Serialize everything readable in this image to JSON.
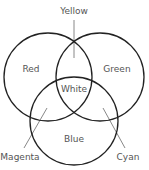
{
  "diagram": {
    "type": "venn",
    "title": "",
    "colors": {
      "circle_stroke": "#222222",
      "leader_line": "#888888",
      "label_text": "#555555",
      "background": "#ffffff"
    },
    "sets": [
      {
        "id": "red",
        "label": "Red",
        "cx": 48,
        "cy": 77,
        "r": 44
      },
      {
        "id": "green",
        "label": "Green",
        "cx": 100,
        "cy": 77,
        "r": 44
      },
      {
        "id": "blue",
        "label": "Blue",
        "cx": 74,
        "cy": 121,
        "r": 44
      }
    ],
    "labels": {
      "red": "Red",
      "green": "Green",
      "blue": "Blue",
      "white": "White",
      "yellow": "Yellow",
      "magenta": "Magenta",
      "cyan": "Cyan"
    },
    "intersections": [
      {
        "sets": [
          "red",
          "green"
        ],
        "label": "Yellow"
      },
      {
        "sets": [
          "red",
          "blue"
        ],
        "label": "Magenta"
      },
      {
        "sets": [
          "green",
          "blue"
        ],
        "label": "Cyan"
      },
      {
        "sets": [
          "red",
          "green",
          "blue"
        ],
        "label": "White"
      }
    ]
  }
}
